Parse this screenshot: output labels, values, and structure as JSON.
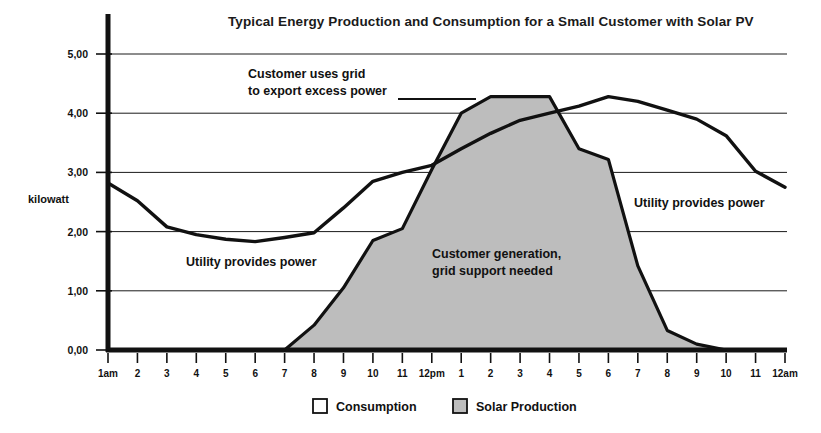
{
  "chart_data": {
    "type": "area",
    "title": "Typical Energy Production and Consumption for a Small Customer with Solar PV",
    "xlabel": "",
    "ylabel": "kilowatt",
    "ylim": [
      0,
      5
    ],
    "grid": true,
    "legend_position": "bottom",
    "y_ticks": [
      "0,00",
      "1,00",
      "2,00",
      "3,00",
      "4,00",
      "5,00"
    ],
    "y_tick_values": [
      0,
      1,
      2,
      3,
      4,
      5
    ],
    "categories": [
      "1am",
      "2",
      "3",
      "4",
      "5",
      "6",
      "7",
      "8",
      "9",
      "10",
      "11",
      "12pm",
      "1",
      "2",
      "3",
      "4",
      "5",
      "6",
      "7",
      "8",
      "9",
      "10",
      "11",
      "12am"
    ],
    "series": [
      {
        "name": "Consumption",
        "style": "line",
        "values": [
          2.82,
          2.52,
          2.08,
          1.95,
          1.87,
          1.83,
          1.9,
          1.98,
          2.4,
          2.85,
          3.0,
          3.12,
          3.4,
          3.66,
          3.88,
          4.0,
          4.12,
          4.28,
          4.2,
          4.05,
          3.9,
          3.62,
          3.02,
          2.75
        ]
      },
      {
        "name": "Solar Production",
        "style": "filled-area",
        "values": [
          0,
          0,
          0,
          0,
          0,
          0,
          0,
          0.42,
          1.05,
          1.85,
          2.05,
          3.05,
          4.0,
          4.28,
          4.28,
          4.28,
          3.4,
          3.22,
          1.42,
          0.33,
          0.1,
          0,
          0,
          0
        ]
      }
    ],
    "annotations": [
      {
        "id": "export-excess",
        "lines": [
          "Customer uses grid",
          "to export excess power"
        ],
        "has_leader_line": true
      },
      {
        "id": "utility-left",
        "lines": [
          "Utility provides power"
        ],
        "has_leader_line": false
      },
      {
        "id": "customer-generation",
        "lines": [
          "Customer generation,",
          "grid support needed"
        ],
        "has_leader_line": false
      },
      {
        "id": "utility-right",
        "lines": [
          "Utility provides power"
        ],
        "has_leader_line": false
      }
    ],
    "colors": {
      "solar_fill": "#bdbdbd",
      "line": "#111111",
      "grid": "#1a1a1a",
      "background": "#ffffff"
    }
  },
  "legend": {
    "items": [
      {
        "label": "Consumption",
        "swatch": "#ffffff"
      },
      {
        "label": "Solar Production",
        "swatch": "#bdbdbd"
      }
    ]
  }
}
